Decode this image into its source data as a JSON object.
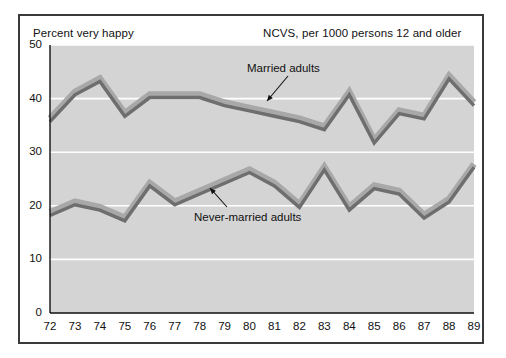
{
  "header": {
    "left_label": "Percent very happy",
    "right_label": "NCVS, per 1000 persons 12 and older"
  },
  "annotations": {
    "married": "Married adults",
    "never_married": "Never-married adults"
  },
  "axes": {
    "y_ticks": [
      "0",
      "10",
      "20",
      "30",
      "40",
      "50"
    ],
    "x_ticks": [
      "72",
      "73",
      "74",
      "75",
      "76",
      "77",
      "78",
      "79",
      "80",
      "81",
      "82",
      "83",
      "84",
      "85",
      "86",
      "87",
      "88",
      "89"
    ]
  },
  "colors": {
    "plot_background": "#d4d4d4",
    "gridline": "#ffffff",
    "line_dark": "#6e6e6e",
    "line_light": "#a8a8a8",
    "frame_border": "#3a3a3a",
    "text": "#111111",
    "page_background": "#ffffff"
  },
  "chart_data": {
    "type": "line",
    "title": "Percent very happy",
    "subtitle": "NCVS, per 1000 persons 12 and older",
    "xlabel": "",
    "ylabel": "Percent very happy",
    "x": [
      72,
      73,
      74,
      75,
      76,
      77,
      78,
      79,
      80,
      81,
      82,
      83,
      84,
      85,
      86,
      87,
      88,
      89
    ],
    "categories": [
      "72",
      "73",
      "74",
      "75",
      "76",
      "77",
      "78",
      "79",
      "80",
      "81",
      "82",
      "83",
      "84",
      "85",
      "86",
      "87",
      "88",
      "89"
    ],
    "ylim": [
      0,
      50
    ],
    "ytick_step": 10,
    "grid": true,
    "legend": "inline-annotations",
    "series": [
      {
        "name": "Married adults",
        "values": [
          36.0,
          41.0,
          43.5,
          37.0,
          40.5,
          40.5,
          40.5,
          39.0,
          38.0,
          37.0,
          36.0,
          34.5,
          41.0,
          32.0,
          37.5,
          36.5,
          44.0,
          39.0
        ]
      },
      {
        "name": "Never-married adults",
        "values": [
          18.5,
          20.5,
          19.5,
          17.5,
          24.0,
          20.5,
          22.5,
          24.5,
          26.5,
          24.0,
          20.0,
          27.0,
          19.5,
          23.5,
          22.5,
          18.0,
          21.0,
          27.5
        ]
      }
    ]
  }
}
